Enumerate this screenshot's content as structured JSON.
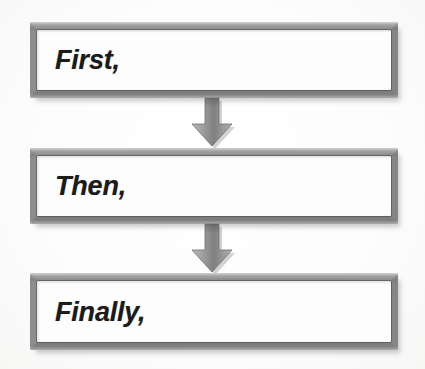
{
  "diagram": {
    "background_color": "#ffffff",
    "box_border_color": "#8b8b8b",
    "box_fill_color": "#fdfdfd",
    "arrow_color": "#8a8a8a",
    "text_color": "#1b1b1b",
    "steps": [
      {
        "label": "First,",
        "order": 1
      },
      {
        "label": "Then,",
        "order": 2
      },
      {
        "label": "Finally,",
        "order": 3
      }
    ],
    "connectors": [
      {
        "icon": "down-arrow-icon",
        "from": 1,
        "to": 2
      },
      {
        "icon": "down-arrow-icon",
        "from": 2,
        "to": 3
      }
    ]
  }
}
